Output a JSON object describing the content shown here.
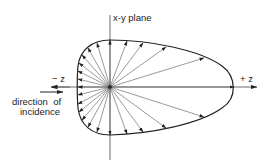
{
  "labels": {
    "plane": "x-y plane",
    "minus_z": "− z",
    "plus_z": "+ z",
    "incidence_line1": "direction  of",
    "incidence_line2": "incidence"
  },
  "colors": {
    "stroke": "#222222",
    "ray": "#555555",
    "background": "#ffffff"
  },
  "geometry": {
    "center": [
      110,
      87
    ],
    "ray_endpoints": [
      [
        110,
        40
      ],
      [
        127,
        41
      ],
      [
        143,
        43
      ],
      [
        166,
        47
      ],
      [
        204,
        58
      ],
      [
        234,
        87
      ],
      [
        204,
        117
      ],
      [
        166,
        128
      ],
      [
        143,
        132
      ],
      [
        127,
        134
      ],
      [
        110,
        135
      ],
      [
        97,
        132
      ],
      [
        88,
        127
      ],
      [
        82,
        120
      ],
      [
        79,
        112
      ],
      [
        78,
        104
      ],
      [
        78,
        95
      ],
      [
        78,
        87
      ],
      [
        78,
        79
      ],
      [
        78,
        71
      ],
      [
        79,
        63
      ],
      [
        82,
        55
      ],
      [
        88,
        48
      ],
      [
        97,
        43
      ]
    ]
  }
}
